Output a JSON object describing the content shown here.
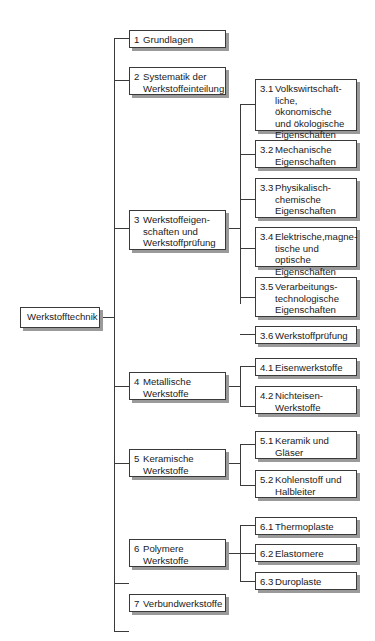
{
  "root": {
    "label": "Werkstofftechnik"
  },
  "level1": [
    {
      "num": "1",
      "text": "Grundlagen"
    },
    {
      "num": "2",
      "text": "Systematik der\nWerkstoffeinteilung"
    },
    {
      "num": "3",
      "text": "Werkstoffeigen-\nschaften und\nWerkstoffprüfung"
    },
    {
      "num": "4",
      "text": "Metallische\nWerkstoffe"
    },
    {
      "num": "5",
      "text": "Keramische\nWerkstoffe"
    },
    {
      "num": "6",
      "text": "Polymere\nWerkstoffe"
    },
    {
      "num": "7",
      "text": "Verbundwerkstoffe"
    }
  ],
  "level2": {
    "3": [
      {
        "num": "3.1",
        "text": "Volkswirtschaft-\nliche, ökonomische\nund ökologische\nEigenschaften"
      },
      {
        "num": "3.2",
        "text": "Mechanische\nEigenschaften"
      },
      {
        "num": "3.3",
        "text": "Physikalisch-\nchemische\nEigenschaften"
      },
      {
        "num": "3.4",
        "text": "Elektrische,magne-\ntische und optische\nEigenschaften"
      },
      {
        "num": "3.5",
        "text": "Verarbeitungs-\ntechnologische\nEigenschaften"
      },
      {
        "num": "3.6",
        "text": "Werkstoffprüfung"
      }
    ],
    "4": [
      {
        "num": "4.1",
        "text": "Eisenwerkstoffe"
      },
      {
        "num": "4.2",
        "text": "Nichteisen-\nWerkstoffe"
      }
    ],
    "5": [
      {
        "num": "5.1",
        "text": "Keramik und\nGläser"
      },
      {
        "num": "5.2",
        "text": "Kohlenstoff und\nHalbleiter"
      }
    ],
    "6": [
      {
        "num": "6.1",
        "text": "Thermoplaste"
      },
      {
        "num": "6.2",
        "text": "Elastomere"
      },
      {
        "num": "6.3",
        "text": "Duroplaste"
      }
    ]
  }
}
